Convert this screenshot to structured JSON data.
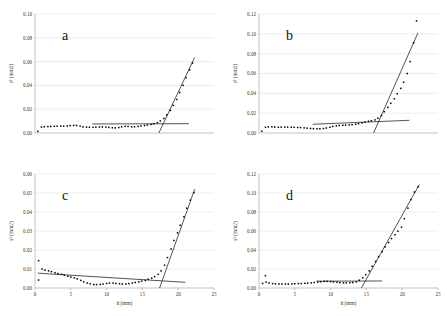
{
  "figure": {
    "name": "four-panel-scatter-figure",
    "background": "#ffffff",
    "marker_color": "#000000",
    "fit_line_color": "#1a1a1a",
    "grid_color": "#d9d9d9"
  },
  "chart_data": [
    {
      "type": "scatter",
      "panel": "a",
      "title": "a",
      "xlabel": "",
      "ylabel": "s² (mm2)",
      "xlim": [
        0,
        25
      ],
      "ylim": [
        0,
        0.1
      ],
      "xticks": [],
      "xticklabels": [],
      "yticks": [
        0.0,
        0.02,
        0.04,
        0.06,
        0.08,
        0.1
      ],
      "yticklabels": [
        "0.00",
        "0.02",
        "0.04",
        "0.06",
        "0.08",
        "0.10"
      ],
      "grid": true,
      "x": [
        0.4,
        0.9,
        1.3,
        1.8,
        2.2,
        2.7,
        3.1,
        3.6,
        4.0,
        4.5,
        4.9,
        5.4,
        5.8,
        6.3,
        6.7,
        7.2,
        7.6,
        8.1,
        8.5,
        9.0,
        9.4,
        9.9,
        10.3,
        10.8,
        11.2,
        11.7,
        12.1,
        12.6,
        13.0,
        13.5,
        13.9,
        14.4,
        14.8,
        15.3,
        15.7,
        16.2,
        16.6,
        17.1,
        17.5,
        18.0,
        18.4,
        18.9,
        19.3,
        19.8,
        20.2,
        20.7,
        21.1,
        21.6,
        22.0
      ],
      "y": [
        0.0014,
        0.005,
        0.0052,
        0.0054,
        0.0055,
        0.0056,
        0.0057,
        0.0058,
        0.0058,
        0.0059,
        0.0062,
        0.0064,
        0.0063,
        0.0058,
        0.0052,
        0.0049,
        0.0048,
        0.0048,
        0.0049,
        0.005,
        0.0051,
        0.005,
        0.0047,
        0.0044,
        0.0043,
        0.0046,
        0.0052,
        0.0056,
        0.0055,
        0.0052,
        0.0052,
        0.0055,
        0.0059,
        0.0063,
        0.0067,
        0.0072,
        0.0078,
        0.0087,
        0.0101,
        0.0122,
        0.0152,
        0.019,
        0.0232,
        0.0282,
        0.034,
        0.04,
        0.0465,
        0.053,
        0.0588
      ],
      "fit_baseline": {
        "x0": 8.0,
        "y0": 0.0076,
        "x1": 21.5,
        "y1": 0.0078
      },
      "fit_rise": {
        "x0": 17.3,
        "y0": 0.0,
        "x1": 22.3,
        "y1": 0.0635
      },
      "breakpoint_h": 17.9
    },
    {
      "type": "scatter",
      "panel": "b",
      "title": "b",
      "xlabel": "",
      "ylabel": "s² (mm2)",
      "xlim": [
        0,
        25
      ],
      "ylim": [
        0,
        0.12
      ],
      "xticks": [],
      "xticklabels": [],
      "yticks": [
        0.0,
        0.02,
        0.04,
        0.06,
        0.08,
        0.1,
        0.12
      ],
      "yticklabels": [
        "0.00",
        "0.02",
        "0.04",
        "0.06",
        "0.08",
        "0.10",
        "0.12"
      ],
      "grid": true,
      "x": [
        0.4,
        0.9,
        1.3,
        1.8,
        2.2,
        2.7,
        3.1,
        3.6,
        4.0,
        4.5,
        4.9,
        5.4,
        5.8,
        6.3,
        6.7,
        7.2,
        7.6,
        8.1,
        8.5,
        9.0,
        9.4,
        9.9,
        10.3,
        10.8,
        11.2,
        11.7,
        12.1,
        12.6,
        13.0,
        13.5,
        13.9,
        14.4,
        14.8,
        15.3,
        15.7,
        16.2,
        16.6,
        17.1,
        17.5,
        18.0,
        18.4,
        18.9,
        19.3,
        19.8,
        20.2,
        20.7,
        21.1,
        21.6,
        22.0
      ],
      "y": [
        0.0018,
        0.0057,
        0.0062,
        0.0063,
        0.006,
        0.0058,
        0.0059,
        0.006,
        0.0059,
        0.0058,
        0.0057,
        0.0056,
        0.0055,
        0.0052,
        0.0049,
        0.0046,
        0.0044,
        0.0043,
        0.0043,
        0.0045,
        0.005,
        0.0058,
        0.0066,
        0.0072,
        0.0076,
        0.0078,
        0.0079,
        0.0081,
        0.0084,
        0.0088,
        0.0094,
        0.0102,
        0.011,
        0.0118,
        0.0124,
        0.0132,
        0.0148,
        0.0176,
        0.0215,
        0.0258,
        0.03,
        0.0345,
        0.0396,
        0.045,
        0.0512,
        0.06,
        0.072,
        0.091,
        0.113
      ],
      "fit_baseline": {
        "x0": 7.5,
        "y0": 0.0088,
        "x1": 21.0,
        "y1": 0.0128
      },
      "fit_rise": {
        "x0": 16.0,
        "y0": 0.0,
        "x1": 22.2,
        "y1": 0.101
      },
      "breakpoint_h": 16.8
    },
    {
      "type": "scatter",
      "panel": "c",
      "title": "c",
      "xlabel": "h (mm)",
      "ylabel": "s² (mm2)",
      "xlim": [
        0,
        25
      ],
      "ylim": [
        0,
        0.06
      ],
      "xticks": [
        0,
        5,
        10,
        15,
        20,
        25
      ],
      "xticklabels": [
        "0",
        "5",
        "10",
        "15",
        "20",
        "25"
      ],
      "yticks": [
        0.0,
        0.01,
        0.02,
        0.03,
        0.04,
        0.05,
        0.06
      ],
      "yticklabels": [
        "0.00",
        "0.01",
        "0.02",
        "0.03",
        "0.04",
        "0.05",
        "0.06"
      ],
      "grid": true,
      "x": [
        0.5,
        0.5,
        1.0,
        1.4,
        1.9,
        2.3,
        2.8,
        3.2,
        3.7,
        4.1,
        4.6,
        5.0,
        5.5,
        5.9,
        6.4,
        6.8,
        7.3,
        7.7,
        8.2,
        8.6,
        9.1,
        9.5,
        10.0,
        10.4,
        10.9,
        11.3,
        11.8,
        12.2,
        12.7,
        13.1,
        13.6,
        14.0,
        14.5,
        14.9,
        15.4,
        15.8,
        16.3,
        16.7,
        17.2,
        17.6,
        18.1,
        18.5,
        19.0,
        19.4,
        19.9,
        20.3,
        20.8,
        21.2,
        21.7,
        22.2
      ],
      "y": [
        0.0042,
        0.0144,
        0.01,
        0.0094,
        0.009,
        0.0086,
        0.008,
        0.0076,
        0.0072,
        0.0068,
        0.0062,
        0.0058,
        0.0053,
        0.0048,
        0.004,
        0.0032,
        0.0026,
        0.0022,
        0.0018,
        0.0018,
        0.0019,
        0.0021,
        0.0024,
        0.0026,
        0.0026,
        0.0024,
        0.0022,
        0.0021,
        0.0021,
        0.0023,
        0.0026,
        0.0029,
        0.0032,
        0.0036,
        0.004,
        0.0046,
        0.0052,
        0.006,
        0.0072,
        0.009,
        0.012,
        0.016,
        0.0205,
        0.025,
        0.029,
        0.033,
        0.0375,
        0.042,
        0.0462,
        0.0502
      ],
      "fit_baseline": {
        "x0": 0.4,
        "y0": 0.0078,
        "x1": 21.0,
        "y1": 0.003
      },
      "fit_rise": {
        "x0": 17.4,
        "y0": 0.0,
        "x1": 22.3,
        "y1": 0.052
      },
      "breakpoint_h": 17.7
    },
    {
      "type": "scatter",
      "panel": "d",
      "title": "d",
      "xlabel": "h (mm)",
      "ylabel": "s² (mm2)",
      "xlim": [
        0,
        25
      ],
      "ylim": [
        0,
        0.12
      ],
      "xticks": [
        0,
        5,
        10,
        15,
        20,
        25
      ],
      "xticklabels": [
        "0",
        "5",
        "10",
        "15",
        "20",
        "25"
      ],
      "yticks": [
        0.0,
        0.02,
        0.04,
        0.06,
        0.08,
        0.1,
        0.12
      ],
      "yticklabels": [
        "0.00",
        "0.02",
        "0.04",
        "0.06",
        "0.08",
        "0.10",
        "0.12"
      ],
      "grid": true,
      "x": [
        0.5,
        0.9,
        1.0,
        1.4,
        1.9,
        2.3,
        2.8,
        3.2,
        3.7,
        4.1,
        4.6,
        5.0,
        5.5,
        5.9,
        6.4,
        6.8,
        7.3,
        7.7,
        8.2,
        8.6,
        9.1,
        9.5,
        10.0,
        10.4,
        10.9,
        11.3,
        11.8,
        12.2,
        12.7,
        13.1,
        13.6,
        14.0,
        14.5,
        14.9,
        15.4,
        15.8,
        16.3,
        16.7,
        17.2,
        17.6,
        18.1,
        18.5,
        19.0,
        19.4,
        19.9,
        20.3,
        20.8,
        21.2,
        21.7,
        22.2
      ],
      "y": [
        0.0048,
        0.013,
        0.0062,
        0.0052,
        0.0046,
        0.0044,
        0.0042,
        0.0041,
        0.0042,
        0.0041,
        0.0043,
        0.0045,
        0.0046,
        0.0047,
        0.0049,
        0.0051,
        0.0054,
        0.0058,
        0.0062,
        0.0066,
        0.007,
        0.007,
        0.0068,
        0.0064,
        0.006,
        0.0057,
        0.0054,
        0.0054,
        0.0056,
        0.0058,
        0.0064,
        0.0082,
        0.0108,
        0.014,
        0.018,
        0.0228,
        0.028,
        0.033,
        0.0382,
        0.0432,
        0.0478,
        0.052,
        0.056,
        0.0598,
        0.064,
        0.073,
        0.084,
        0.093,
        0.101,
        0.1065
      ],
      "fit_baseline": {
        "x0": 8.0,
        "y0": 0.0072,
        "x1": 17.2,
        "y1": 0.0074
      },
      "fit_rise": {
        "x0": 14.3,
        "y0": 0.0,
        "x1": 22.4,
        "y1": 0.109
      },
      "breakpoint_h": 14.9
    }
  ]
}
